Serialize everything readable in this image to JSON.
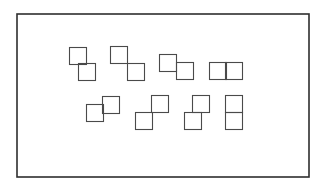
{
  "diagram": {
    "frame": {
      "x": 17,
      "y": 14,
      "width": 292,
      "height": 163,
      "stroke": "#2e2e2e"
    },
    "square_size": 17,
    "square_stroke": "#4a4a4a",
    "rows": [
      {
        "name": "top-row",
        "pairs": [
          {
            "id": "pair-1",
            "arrangement": "offset-overlap-down-right",
            "squares": [
              {
                "x": 69,
                "y": 47
              },
              {
                "x": 78,
                "y": 63
              }
            ]
          },
          {
            "id": "pair-2",
            "arrangement": "corner-touch-down-right",
            "squares": [
              {
                "x": 110,
                "y": 46
              },
              {
                "x": 127,
                "y": 63
              }
            ]
          },
          {
            "id": "pair-3",
            "arrangement": "edge-offset-right-down",
            "squares": [
              {
                "x": 159,
                "y": 54
              },
              {
                "x": 176,
                "y": 62
              }
            ]
          },
          {
            "id": "pair-4",
            "arrangement": "side-by-side-horizontal",
            "squares": [
              {
                "x": 209,
                "y": 62
              },
              {
                "x": 225,
                "y": 62
              }
            ]
          }
        ]
      },
      {
        "name": "bottom-row",
        "pairs": [
          {
            "id": "pair-5",
            "arrangement": "edge-offset-right-up",
            "squares": [
              {
                "x": 86,
                "y": 104
              },
              {
                "x": 102,
                "y": 96
              }
            ]
          },
          {
            "id": "pair-6",
            "arrangement": "corner-touch-up-right",
            "squares": [
              {
                "x": 135,
                "y": 112
              },
              {
                "x": 151,
                "y": 95
              }
            ]
          },
          {
            "id": "pair-7",
            "arrangement": "offset-overlap-up-right",
            "squares": [
              {
                "x": 184,
                "y": 112
              },
              {
                "x": 192,
                "y": 95
              }
            ]
          },
          {
            "id": "pair-8",
            "arrangement": "stacked-vertical",
            "squares": [
              {
                "x": 225,
                "y": 95
              },
              {
                "x": 225,
                "y": 112
              }
            ]
          }
        ]
      }
    ]
  }
}
